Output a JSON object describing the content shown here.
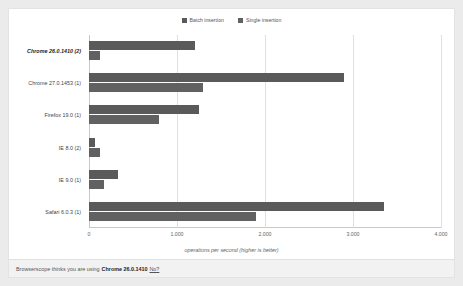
{
  "chart_data": {
    "type": "bar",
    "orientation": "horizontal",
    "title": "",
    "xlabel": "operations per second (higher is better)",
    "ylabel": "",
    "xlim": [
      0,
      4000
    ],
    "grid": true,
    "legend_position": "top-center",
    "categories": [
      "Chrome 26.0.1410 (2)",
      "Chrome 27.0.1453 (1)",
      "Firefox 19.0 (1)",
      "IE 8.0 (2)",
      "IE 9.0 (1)",
      "Safari 6.0.3 (1)"
    ],
    "series": [
      {
        "name": "Batch insertion",
        "color": "#5a5a5a",
        "values": [
          1200,
          2900,
          1250,
          70,
          330,
          3350
        ]
      },
      {
        "name": "Single insertion",
        "color": "#616161",
        "values": [
          130,
          1300,
          800,
          130,
          170,
          1900
        ]
      }
    ],
    "xticks": [
      0,
      1000,
      2000,
      3000,
      4000
    ],
    "xtick_labels": [
      "0",
      "1.000",
      "2.000",
      "3.000",
      "4.000"
    ],
    "highlighted_category": "Chrome 26.0.1410 (2)"
  },
  "footer": {
    "prefix": "Browserscope thinks you are using",
    "browser": "Chrome 26.0.1410",
    "link_label": "No?"
  }
}
